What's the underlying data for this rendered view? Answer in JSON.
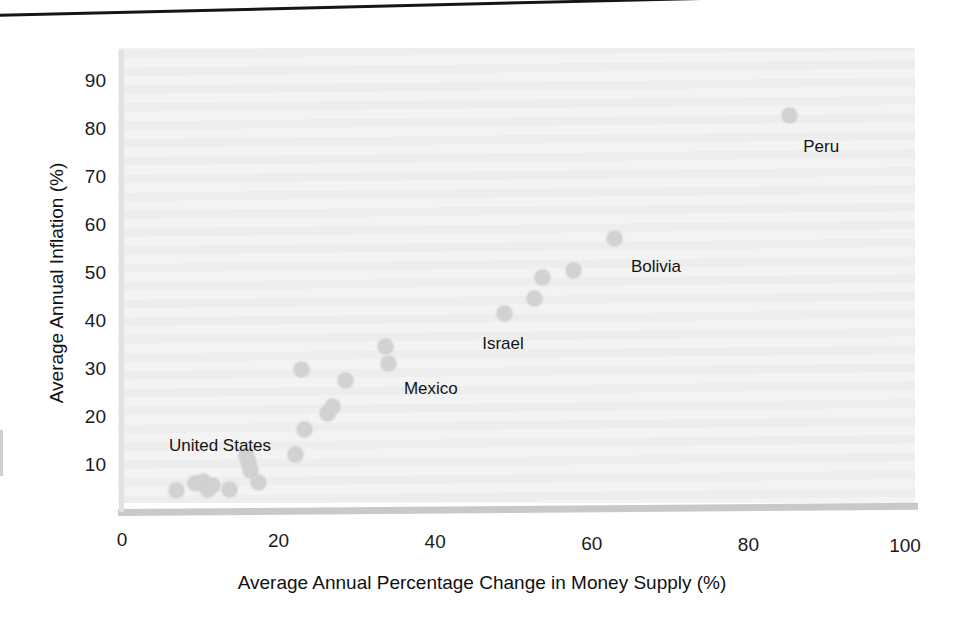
{
  "figure": {
    "background_color": "#ffffff",
    "panel_color": "#f3f3f3",
    "point_color": "#d2d2d2",
    "rule_color": "#151515"
  },
  "axis": {
    "x_title": "Average Annual Percentage Change in Money Supply (%)",
    "y_title": "Average Annual Inflation (%)",
    "x_ticks": [
      "0",
      "20",
      "40",
      "60",
      "80",
      "100"
    ],
    "y_ticks": [
      "90",
      "80",
      "70",
      "60",
      "50",
      "40",
      "30",
      "20",
      "10"
    ]
  },
  "chart_data": {
    "type": "scatter",
    "title": "",
    "xlabel": "Average Annual Percentage Change in Money Supply (%)",
    "ylabel": "Average Annual Inflation (%)",
    "xlim": [
      0,
      100
    ],
    "ylim": [
      0,
      90
    ],
    "xticks": [
      0,
      20,
      40,
      60,
      80,
      100
    ],
    "yticks": [
      10,
      20,
      30,
      40,
      50,
      60,
      70,
      80,
      90
    ],
    "grid": false,
    "legend": null,
    "points": [
      {
        "x": 7.0,
        "y": 5.0,
        "label": null
      },
      {
        "x": 9.4,
        "y": 6.4,
        "label": null
      },
      {
        "x": 10.4,
        "y": 6.8,
        "label": null
      },
      {
        "x": 10.9,
        "y": 5.2,
        "label": null
      },
      {
        "x": 11.6,
        "y": 5.9,
        "label": null
      },
      {
        "x": 13.7,
        "y": 5.1,
        "label": null
      },
      {
        "x": 15.9,
        "y": 12.2,
        "label": null
      },
      {
        "x": 16.2,
        "y": 10.7,
        "label": null
      },
      {
        "x": 16.4,
        "y": 9.1,
        "label": null
      },
      {
        "x": 17.4,
        "y": 6.6,
        "label": null
      },
      {
        "x": 22.2,
        "y": 12.5,
        "label": null
      },
      {
        "x": 22.9,
        "y": 30.2,
        "label": null
      },
      {
        "x": 23.3,
        "y": 17.7,
        "label": null
      },
      {
        "x": 26.2,
        "y": 20.9,
        "label": null
      },
      {
        "x": 26.9,
        "y": 22.3,
        "label": null
      },
      {
        "x": 28.6,
        "y": 27.8,
        "label": null
      },
      {
        "x": 33.7,
        "y": 34.8,
        "label": null
      },
      {
        "x": 34.0,
        "y": 31.3,
        "label": "Mexico"
      },
      {
        "x": 48.9,
        "y": 41.7,
        "label": "Israel"
      },
      {
        "x": 52.7,
        "y": 44.8,
        "label": null
      },
      {
        "x": 53.7,
        "y": 49.3,
        "label": null
      },
      {
        "x": 57.6,
        "y": 50.8,
        "label": null
      },
      {
        "x": 62.9,
        "y": 57.5,
        "label": "Bolivia"
      },
      {
        "x": 85.2,
        "y": 83.0,
        "label": "Peru"
      }
    ],
    "annotations": [
      {
        "text": "United States",
        "x": 6.0,
        "y": 14.2
      },
      {
        "text": "Mexico",
        "x": 36.0,
        "y": 26.0
      },
      {
        "text": "Israel",
        "x": 46.0,
        "y": 35.5
      },
      {
        "text": "Bolivia",
        "x": 65.0,
        "y": 51.5
      },
      {
        "text": "Peru",
        "x": 87.0,
        "y": 76.5
      }
    ]
  }
}
